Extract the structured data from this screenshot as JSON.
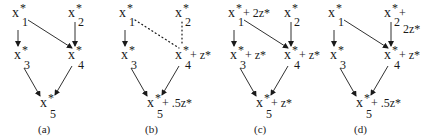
{
  "figure": {
    "panels": [
      {
        "label": "(a)",
        "nodes": [
          {
            "id": "x1",
            "var": "x",
            "sub": "1",
            "star": "*",
            "extra": ""
          },
          {
            "id": "x2",
            "var": "x",
            "sub": "2",
            "star": "*",
            "extra": ""
          },
          {
            "id": "x3",
            "var": "x",
            "sub": "3",
            "star": "*",
            "extra": ""
          },
          {
            "id": "x4",
            "var": "x",
            "sub": "4",
            "star": "*",
            "extra": ""
          },
          {
            "id": "x5",
            "var": "x",
            "sub": "5",
            "star": "*",
            "extra": ""
          }
        ],
        "edges": [
          {
            "from": "x1",
            "to": "x3",
            "style": "solid"
          },
          {
            "from": "x1",
            "to": "x4",
            "style": "solid"
          },
          {
            "from": "x2",
            "to": "x4",
            "style": "solid"
          },
          {
            "from": "x3",
            "to": "x5",
            "style": "solid"
          },
          {
            "from": "x4",
            "to": "x5",
            "style": "solid"
          }
        ]
      },
      {
        "label": "(b)",
        "nodes": [
          {
            "id": "x1",
            "var": "x",
            "sub": "1",
            "star": "*",
            "extra": ""
          },
          {
            "id": "x2",
            "var": "x",
            "sub": "2",
            "star": "*",
            "extra": ""
          },
          {
            "id": "x3",
            "var": "x",
            "sub": "3",
            "star": "*",
            "extra": ""
          },
          {
            "id": "x4",
            "var": "x",
            "sub": "4",
            "star": "*",
            "extra": "+ z*"
          },
          {
            "id": "x5",
            "var": "x",
            "sub": "5",
            "star": "*",
            "extra": "+ .5z*"
          }
        ],
        "edges": [
          {
            "from": "x1",
            "to": "x3",
            "style": "solid"
          },
          {
            "from": "x1",
            "to": "x4",
            "style": "dotted"
          },
          {
            "from": "x2",
            "to": "x4",
            "style": "dotted"
          },
          {
            "from": "x3",
            "to": "x5",
            "style": "solid"
          },
          {
            "from": "x4",
            "to": "x5",
            "style": "solid"
          }
        ]
      },
      {
        "label": "(c)",
        "nodes": [
          {
            "id": "x1",
            "var": "x",
            "sub": "1",
            "star": "*",
            "extra": "+ 2z*"
          },
          {
            "id": "x2",
            "var": "x",
            "sub": "2",
            "star": "*",
            "extra": ""
          },
          {
            "id": "x3",
            "var": "x",
            "sub": "3",
            "star": "*",
            "extra": "+ z*"
          },
          {
            "id": "x4",
            "var": "x",
            "sub": "4",
            "star": "*",
            "extra": "+ z*"
          },
          {
            "id": "x5",
            "var": "x",
            "sub": "5",
            "star": "*",
            "extra": "+ z*"
          }
        ],
        "edges": [
          {
            "from": "x1",
            "to": "x3",
            "style": "solid"
          },
          {
            "from": "x1",
            "to": "x4",
            "style": "solid"
          },
          {
            "from": "x2",
            "to": "x4",
            "style": "solid"
          },
          {
            "from": "x3",
            "to": "x5",
            "style": "solid"
          },
          {
            "from": "x4",
            "to": "x5",
            "style": "solid"
          }
        ]
      },
      {
        "label": "(d)",
        "nodes": [
          {
            "id": "x1",
            "var": "x",
            "sub": "1",
            "star": "*",
            "extra": ""
          },
          {
            "id": "x2",
            "var": "x",
            "sub": "2",
            "star": "*",
            "extra": "+",
            "extra_line2": "2z*"
          },
          {
            "id": "x3",
            "var": "x",
            "sub": "3",
            "star": "*",
            "extra": ""
          },
          {
            "id": "x4",
            "var": "x",
            "sub": "4",
            "star": "*",
            "extra": "+ z*"
          },
          {
            "id": "x5",
            "var": "x",
            "sub": "5",
            "star": "*",
            "extra": "+ .5z*"
          }
        ],
        "edges": [
          {
            "from": "x1",
            "to": "x3",
            "style": "solid"
          },
          {
            "from": "x1",
            "to": "x4",
            "style": "solid"
          },
          {
            "from": "x2",
            "to": "x4",
            "style": "solid"
          },
          {
            "from": "x3",
            "to": "x5",
            "style": "solid"
          },
          {
            "from": "x4",
            "to": "x5",
            "style": "solid"
          }
        ]
      }
    ]
  }
}
